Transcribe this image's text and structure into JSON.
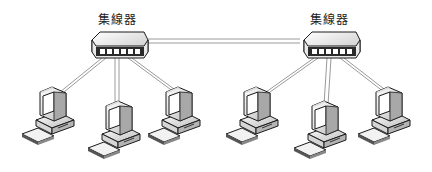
{
  "diagram": {
    "title": "",
    "hubs": [
      {
        "label": "集線器",
        "x": 118,
        "y": 35
      },
      {
        "label": "集線器",
        "x": 330,
        "y": 35
      }
    ],
    "hub_link": {
      "from": 0,
      "to": 1,
      "style": "double-line"
    },
    "computers": [
      {
        "hub": 0,
        "x": 52,
        "y": 115
      },
      {
        "hub": 0,
        "x": 118,
        "y": 130
      },
      {
        "hub": 0,
        "x": 180,
        "y": 115
      },
      {
        "hub": 1,
        "x": 258,
        "y": 115
      },
      {
        "hub": 1,
        "x": 326,
        "y": 130
      },
      {
        "hub": 1,
        "x": 390,
        "y": 115
      }
    ],
    "colors": {
      "line": "#9a9a9a",
      "outline": "#1a1a1a",
      "fill_light": "#f4f4f4",
      "fill_shade": "#c8c8c8",
      "port": "#333333"
    }
  }
}
